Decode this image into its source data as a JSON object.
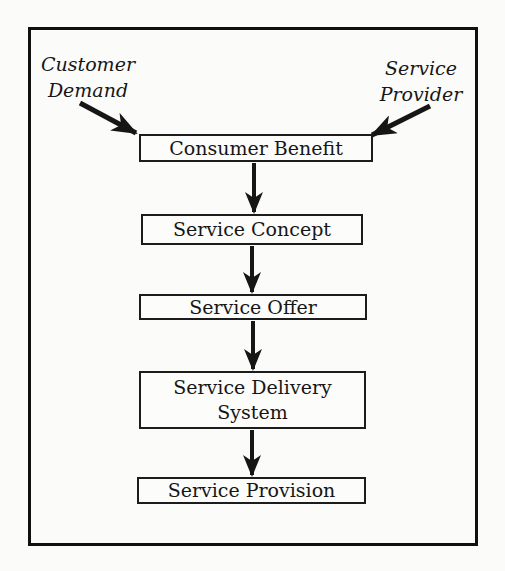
{
  "diagram": {
    "inputs": {
      "customer_demand": {
        "line1": "Customer",
        "line2": "Demand"
      },
      "service_provider": {
        "line1": "Service",
        "line2": "Provider"
      }
    },
    "boxes": [
      {
        "id": "consumer-benefit",
        "label": "Consumer Benefit"
      },
      {
        "id": "service-concept",
        "label": "Service Concept"
      },
      {
        "id": "service-offer",
        "label": "Service Offer"
      },
      {
        "id": "service-delivery-system",
        "label": "Service Delivery System"
      },
      {
        "id": "service-provision",
        "label": "Service Provision"
      }
    ],
    "flow": [
      "Customer Demand -> Consumer Benefit",
      "Service Provider -> Consumer Benefit",
      "Consumer Benefit -> Service Concept",
      "Service Concept -> Service Offer",
      "Service Offer -> Service Delivery System",
      "Service Delivery System -> Service Provision"
    ],
    "colors": {
      "ink": "#161616",
      "paper": "#fbfbf9",
      "frame_border": "#101010",
      "box_border": "#1c1c1c"
    }
  }
}
